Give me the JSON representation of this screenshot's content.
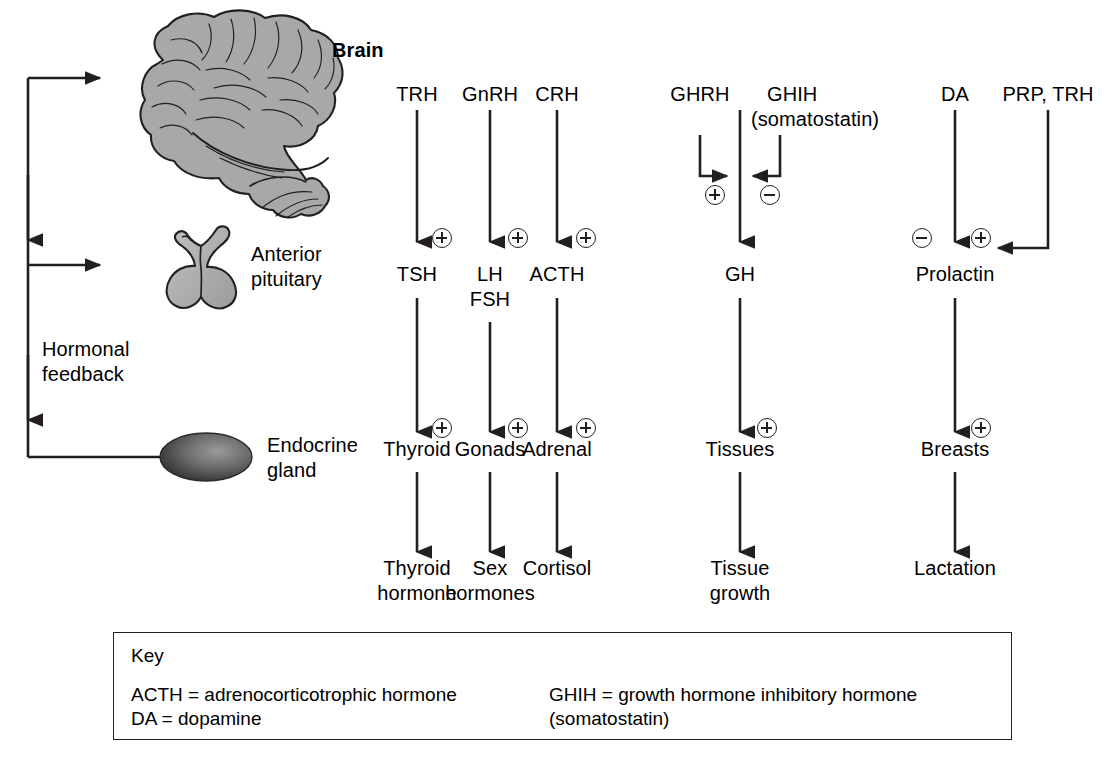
{
  "figure": {
    "type": "flow-diagram",
    "background_color": "#ffffff",
    "line_color": "#231f20"
  },
  "anatomy": {
    "brain_label": "Brain",
    "pituitary_label": "Anterior\npituitary",
    "gland_label": "Endocrine\ngland",
    "brain_fill": "#a8a8a8",
    "pituitary_fill": "#b4b4b4",
    "gland_fill": "#4d4d4d"
  },
  "feedback": {
    "label": "Hormonal\nfeedback"
  },
  "axes": [
    {
      "id": "thyroid-axis",
      "releasing_hormone": "TRH",
      "releasing_sign": "",
      "pituitary_sign": "plus",
      "pituitary_hormone": "TSH",
      "target_sign": "plus",
      "target_organ": "Thyroid",
      "product": "Thyroid\nhormone"
    },
    {
      "id": "gonadal-axis",
      "releasing_hormone": "GnRH",
      "releasing_sign": "",
      "pituitary_sign": "plus",
      "pituitary_hormone": "LH\nFSH",
      "target_sign": "plus",
      "target_organ": "Gonads",
      "product": "Sex\nhormones"
    },
    {
      "id": "adrenal-axis",
      "releasing_hormone": "CRH",
      "releasing_sign": "",
      "pituitary_sign": "plus",
      "pituitary_hormone": "ACTH",
      "target_sign": "plus",
      "target_organ": "Adrenal",
      "product": "Cortisol"
    },
    {
      "id": "growth-axis",
      "releasing_hormone": "GHRH",
      "inhibiting_hormone": "GHIH",
      "inhibiting_hormone_alt": "(somatostatin)",
      "stimulatory_sign": "plus",
      "inhibitory_sign": "minus",
      "pituitary_sign": "",
      "pituitary_hormone": "GH",
      "target_sign": "plus",
      "target_organ": "Tissues",
      "product": "Tissue\ngrowth"
    },
    {
      "id": "prolactin-axis",
      "inhibiting_hormone": "DA",
      "releasing_hormone": "PRP, TRH",
      "inhibitory_sign": "minus",
      "stimulatory_sign": "plus",
      "pituitary_hormone": "Prolactin",
      "target_sign": "plus",
      "target_organ": "Breasts",
      "product": "Lactation"
    }
  ],
  "key": {
    "title": "Key",
    "left_entries": "ACTH = adrenocorticotrophic hormone\nDA = dopamine",
    "right_entries": "GHIH = growth hormone inhibitory hormone\n              (somatostatin)"
  }
}
